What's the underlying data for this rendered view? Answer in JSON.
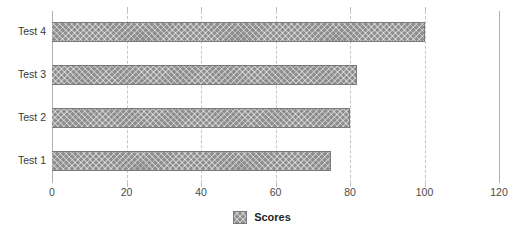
{
  "chart_data": {
    "type": "bar",
    "orientation": "horizontal",
    "title": "",
    "xlabel": "",
    "ylabel": "",
    "categories": [
      "Test 1",
      "Test 2",
      "Test 3",
      "Test 4"
    ],
    "series": [
      {
        "name": "Scores",
        "values": [
          75,
          80,
          82,
          100
        ]
      }
    ],
    "xlim": [
      0,
      120
    ],
    "xticks": [
      0,
      20,
      40,
      60,
      80,
      100,
      120
    ],
    "xtick_labels": [
      "0",
      "20",
      "40",
      "60",
      "80",
      "100",
      "120"
    ],
    "grid": true,
    "grid_axis": "x",
    "grid_style": "dashed",
    "legend": {
      "position": "bottom-center",
      "entries": [
        {
          "label": "Scores",
          "swatch": "hatched-gray-swatch"
        }
      ]
    },
    "display_order_top_to_bottom": [
      "Test 4",
      "Test 3",
      "Test 2",
      "Test 1"
    ],
    "colors": {
      "bar_fill": "#8e8e8e",
      "bar_border": "#7a7a7a",
      "gridline": "#c6c6c6",
      "axis_line": "#b0b0b0",
      "tick_label": "#4a4a4a",
      "category_label": "#3a3a3a",
      "legend_label": "#252525",
      "background": "#ffffff"
    }
  }
}
